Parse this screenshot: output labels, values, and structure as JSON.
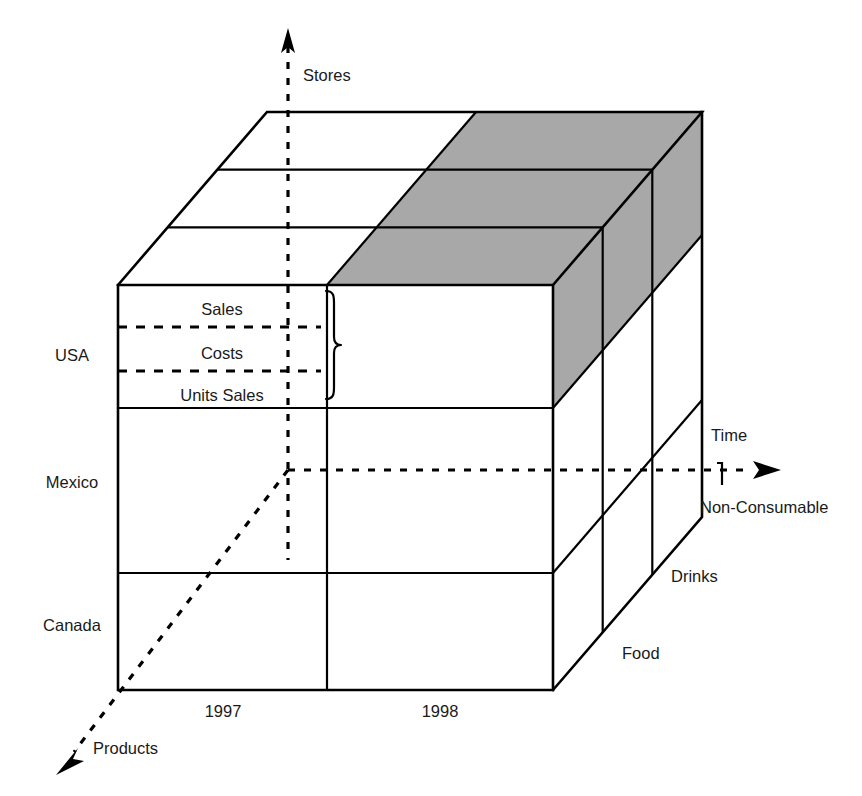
{
  "figure": {
    "type": "3d-cube-diagram",
    "colors": {
      "line": "#000000",
      "face": "#ffffff",
      "highlight": "#a8a8a8",
      "text": "#1a1a1a"
    }
  },
  "axes": {
    "vertical": {
      "name": "stores-axis",
      "label": "Stores",
      "arrow": "up-arrow-icon",
      "style": "dashed"
    },
    "horizontal": {
      "name": "time-axis",
      "label": "Time",
      "arrow": "right-arrow-icon",
      "style": "dashed"
    },
    "depth": {
      "name": "products-axis",
      "label": "Products",
      "arrow": "down-left-arrow-icon",
      "style": "dashed"
    }
  },
  "dimensions": {
    "stores": {
      "axis_label": "Stores",
      "members": [
        "USA",
        "Mexico",
        "Canada"
      ]
    },
    "time": {
      "axis_label": "Time",
      "members": [
        "1997",
        "1998"
      ]
    },
    "products": {
      "axis_label": "Products",
      "members": [
        "Food",
        "Drinks",
        "Non-Consumable"
      ]
    }
  },
  "measures": {
    "bracket_label": "measures-brace",
    "items": [
      "Sales",
      "Costs",
      "Units Sales"
    ]
  },
  "store_labels": {
    "usa": "USA",
    "mexico": "Mexico",
    "canada": "Canada"
  },
  "time_labels": {
    "y1997": "1997",
    "y1998": "1998"
  },
  "product_labels": {
    "food": "Food",
    "drinks": "Drinks",
    "non_consumable": "Non-Consumable"
  },
  "measure_labels": {
    "sales": "Sales",
    "costs": "Costs",
    "units_sales": "Units Sales"
  },
  "axis_labels": {
    "stores": "Stores",
    "time": "Time",
    "products": "Products"
  },
  "highlight": {
    "description": "shaded-slice",
    "time_member": "1998",
    "store_member": "USA"
  }
}
